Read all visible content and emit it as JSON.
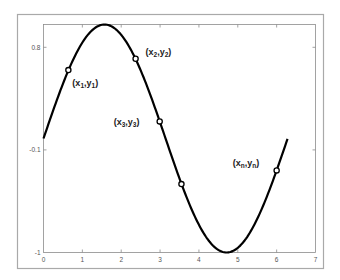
{
  "chart_data": {
    "type": "line",
    "title": "",
    "xlabel": "",
    "ylabel": "",
    "xlim": [
      0,
      7
    ],
    "ylim": [
      -1,
      1
    ],
    "grid": false,
    "x_ticks": [
      "0",
      "1",
      "2",
      "3",
      "4",
      "5",
      "6",
      "7"
    ],
    "y_ticks": [
      {
        "value": 0.8,
        "label": "0.8"
      },
      {
        "value": -0.1,
        "label": "-0.1"
      },
      {
        "value": -1,
        "label": "-1"
      }
    ],
    "series": [
      {
        "name": "sin(x)",
        "function": "sin",
        "x_range": [
          0,
          6.28
        ],
        "color": "#000000",
        "line_width": 2.2
      }
    ],
    "markers": [
      {
        "x": 0.64,
        "y": 0.6,
        "label_main": [
          "x",
          "y"
        ],
        "label_sub": "1",
        "label_dx": 4,
        "label_dy": 16
      },
      {
        "x": 2.37,
        "y": 0.7,
        "label_main": [
          "x",
          "y"
        ],
        "label_sub": "2",
        "label_dx": 10,
        "label_dy": -4
      },
      {
        "x": 2.99,
        "y": 0.15,
        "label_main": [
          "x",
          "y"
        ],
        "label_sub": "3",
        "label_dx": -46,
        "label_dy": 4
      },
      {
        "x": 3.55,
        "y": -0.4,
        "label_main": null,
        "label_sub": null
      },
      {
        "x": 6.0,
        "y": -0.28,
        "label_main": [
          "x",
          "y"
        ],
        "label_sub": "n",
        "label_dx": -44,
        "label_dy": -4
      }
    ]
  },
  "colors": {
    "frame": "#a9a9a9",
    "axis": "#8c8c8c",
    "curve": "#000000",
    "background": "#ffffff"
  }
}
